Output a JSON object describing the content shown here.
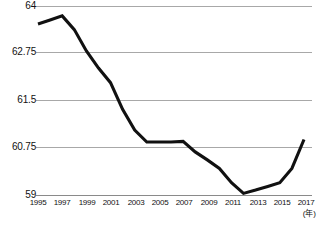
{
  "chart_data": {
    "type": "line",
    "title": "",
    "subtitle": "",
    "xlabel": "(年)",
    "ylabel": "",
    "grid": true,
    "legend": null,
    "x": [
      1995,
      1996,
      1997,
      1998,
      1999,
      2000,
      2001,
      2002,
      2003,
      2004,
      2005,
      2006,
      2007,
      2008,
      2009,
      2010,
      2011,
      2012,
      2013,
      2014,
      2015,
      2016,
      2017
    ],
    "series": [
      {
        "name": "値",
        "values": [
          63.51,
          63.62,
          63.73,
          63.36,
          62.78,
          62.33,
          61.95,
          61.35,
          61.02,
          60.83,
          60.83,
          60.83,
          60.84,
          60.57,
          60.28,
          59.97,
          59.45,
          59.06,
          59.18,
          59.31,
          59.45,
          59.97,
          60.87
        ]
      }
    ],
    "categories_labeled": [
      "1995",
      "1997",
      "1999",
      "2001",
      "2003",
      "2005",
      "2007",
      "2009",
      "2011",
      "2013",
      "2015",
      "2017"
    ],
    "ytick_labels": [
      "64",
      "62.75",
      "61.5",
      "60.75",
      "59"
    ],
    "ytick_values": [
      64,
      62.75,
      61.5,
      60.75,
      59
    ],
    "ylim": [
      59,
      64
    ],
    "xlim": [
      1995,
      2017
    ],
    "colors": {
      "series": "#111111",
      "grid": "#a8a8a8",
      "axis": "#8a8a8a",
      "text": "#111111",
      "background": "#ffffff"
    },
    "axis_unit_note": "(年)",
    "source_note": ""
  }
}
